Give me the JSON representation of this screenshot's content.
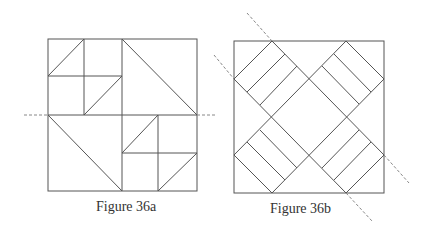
{
  "figures": [
    {
      "id": "36a",
      "caption": "Figure 36a",
      "description": "Square quilt block divided into quadrants with triangles; dashed horizontal fold line through center"
    },
    {
      "id": "36b",
      "caption": "Figure 36b",
      "description": "Square quilt block with diagonal strip bands forming an X; dashed diagonal fold line"
    }
  ],
  "colors": {
    "line": "#555555",
    "dash": "#888888",
    "background": "#ffffff"
  }
}
